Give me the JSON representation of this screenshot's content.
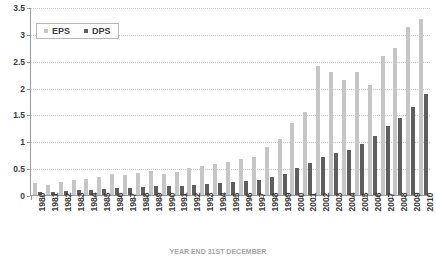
{
  "chart_data": {
    "type": "bar",
    "title": "HISTORY OF EPS AND DPS",
    "caption": "YEAR END 31ST DECEMBER",
    "xlabel": "",
    "ylabel": "",
    "ylim": [
      0,
      3.5
    ],
    "yticks": [
      0,
      0.5,
      1,
      1.5,
      2,
      2.5,
      3,
      3.5
    ],
    "ytick_labels": [
      "0",
      "0.5",
      "1",
      "1.5",
      "2",
      "2.5",
      "3",
      "3.5"
    ],
    "grid": true,
    "legend_position": "top-left",
    "categories": [
      "1980",
      "1981",
      "1982",
      "1983",
      "1984",
      "1985",
      "1986",
      "1987",
      "1988",
      "1989",
      "1990",
      "1991",
      "1992",
      "1993",
      "1994",
      "1995",
      "1996",
      "1997",
      "1998",
      "1999",
      "2000",
      "2001",
      "2002",
      "2003",
      "2004",
      "2005",
      "2006",
      "2007",
      "2008",
      "2009",
      "2010"
    ],
    "series": [
      {
        "name": "EPS",
        "color": "#c6c6c6",
        "values": [
          0.22,
          0.18,
          0.24,
          0.28,
          0.3,
          0.33,
          0.4,
          0.38,
          0.42,
          0.45,
          0.4,
          0.44,
          0.5,
          0.55,
          0.58,
          0.62,
          0.68,
          0.72,
          0.9,
          1.05,
          1.35,
          1.55,
          2.42,
          2.3,
          2.15,
          2.3,
          2.05,
          2.6,
          2.75,
          3.15,
          3.3
        ]
      },
      {
        "name": "DPS",
        "color": "#5e5e5e",
        "values": [
          0.06,
          0.06,
          0.08,
          0.09,
          0.1,
          0.11,
          0.13,
          0.13,
          0.15,
          0.16,
          0.16,
          0.17,
          0.19,
          0.2,
          0.22,
          0.24,
          0.26,
          0.28,
          0.33,
          0.4,
          0.5,
          0.6,
          0.72,
          0.78,
          0.85,
          0.95,
          1.1,
          1.3,
          1.45,
          1.65,
          1.9
        ]
      }
    ]
  },
  "legend": {
    "items": [
      {
        "label": "EPS"
      },
      {
        "label": "DPS"
      }
    ]
  }
}
